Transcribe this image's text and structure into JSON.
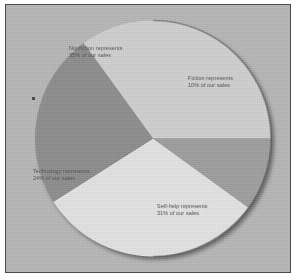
{
  "figure": {
    "background_color": "#ffffff",
    "plate_color": "#b6b6b6",
    "border_color": "#4a4a4a"
  },
  "chart_data": {
    "type": "pie",
    "title": "",
    "subtitle": "",
    "xlabel": "",
    "ylabel": "",
    "legend_position": "none",
    "grid": false,
    "units": "percent",
    "total": 100,
    "start_angle_deg": 0,
    "direction": "clockwise",
    "categories": [
      "Fiction",
      "Self-help",
      "Technology",
      "Nonfiction"
    ],
    "values": [
      10,
      31,
      24,
      35
    ],
    "colors": [
      "#9e9e9e",
      "#e2e2e2",
      "#8d8d8d",
      "#cfcfcf"
    ],
    "slices": [
      {
        "name": "Fiction",
        "value": 10,
        "color": "#9e9e9e",
        "start_angle_deg": 0,
        "end_angle_deg": 36,
        "label_line1": "Fiction represents",
        "label_line2": "10% of our sales"
      },
      {
        "name": "Self-help",
        "value": 31,
        "color": "#e2e2e2",
        "start_angle_deg": 36,
        "end_angle_deg": 147.6,
        "label_line1": "Self-help represents",
        "label_line2": "31% of our sales"
      },
      {
        "name": "Technology",
        "value": 24,
        "color": "#8d8d8d",
        "start_angle_deg": 147.6,
        "end_angle_deg": 234,
        "label_line1": "Technology represents",
        "label_line2": "24% of our sales"
      },
      {
        "name": "Nonfiction",
        "value": 35,
        "color": "#cfcfcf",
        "start_angle_deg": 234,
        "end_angle_deg": 360,
        "label_line1": "Nonfiction represents",
        "label_line2": "35% of our sales"
      }
    ]
  }
}
